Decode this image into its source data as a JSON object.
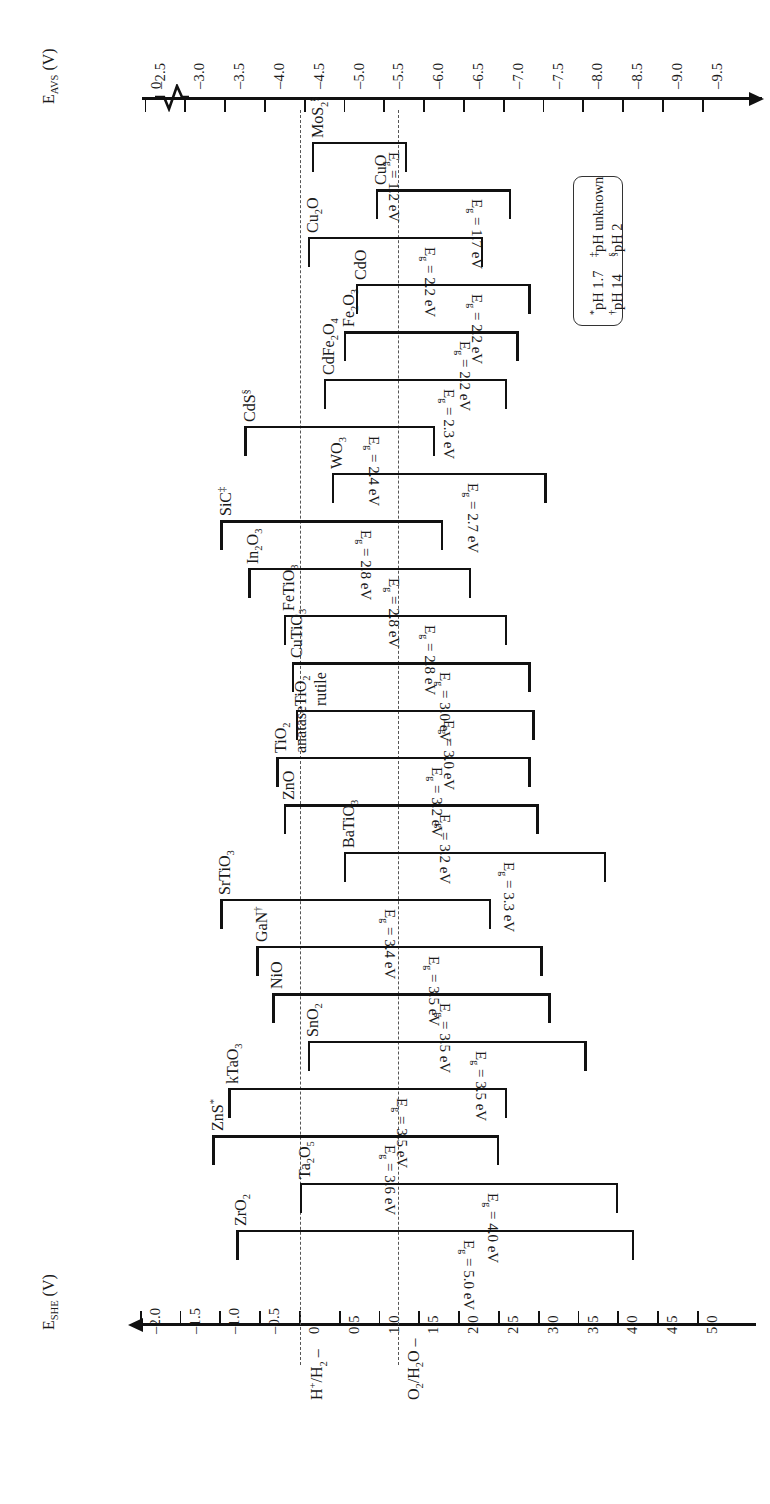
{
  "figure": {
    "top_axis": {
      "label_main": "E",
      "label_sub": "AVS",
      "label_unit": "(V)",
      "ticks": [
        "0",
        "–2.5",
        "–3.0",
        "–3.5",
        "–4.0",
        "–4.5",
        "–5.0",
        "–5.5",
        "–6.0",
        "–6.5",
        "–7.0",
        "–7.5",
        "–8.0",
        "–8.5",
        "–9.0",
        "–9.5"
      ]
    },
    "bottom_axis": {
      "label_main": "E",
      "label_sub": "SHE",
      "label_unit": "(V)",
      "ticks": [
        "–2.0",
        "–1.5",
        "–1.0",
        "–0.5",
        "0",
        "0.5",
        "1.0",
        "1.5",
        "2.0",
        "2.5",
        "3.0",
        "3.5",
        "4.0",
        "4.5",
        "5.0"
      ]
    },
    "redox_levels": [
      {
        "name": "hydrogen-redox",
        "label_html": "H<sup>+</sup>/H<sub>2</sub> –",
        "value_she": 0.0
      },
      {
        "name": "oxygen-redox",
        "label_html": "O<sub>2</sub>/H<sub>2</sub>O –",
        "value_she": 1.23
      }
    ],
    "legend": {
      "items": [
        {
          "marker": "*",
          "text": "pH 1.7"
        },
        {
          "marker": "†",
          "text": "pH 14"
        },
        {
          "marker": "‡",
          "text": "pH unknown"
        },
        {
          "marker": "§",
          "text": "pH 2"
        }
      ]
    }
  },
  "chart_data": {
    "type": "bar",
    "xlabel": "E_SHE (V)",
    "ylabel": "",
    "xlim": [
      -2.5,
      5.2
    ],
    "grid": false,
    "legend_position": "right",
    "note": "Each entry is a conduction-band (CBM) to valence-band (VBM) bracket on the SHE potential scale; gap = VBM - CBM.",
    "columns": [
      "material",
      "cbm_she_V",
      "vbm_she_V",
      "band_gap_eV",
      "gap_label",
      "ph_marker"
    ],
    "materials": [
      {
        "material": "MoS₂",
        "formula_html": "MoS<sub>2</sub><sup>§</sup>",
        "cbm_she_V": 0.15,
        "vbm_she_V": 1.35,
        "band_gap_eV": 1.2,
        "gap_label": "E<sub>g</sub> = 1.2 eV",
        "ph_marker": "§"
      },
      {
        "material": "CuO",
        "formula_html": "CuO",
        "cbm_she_V": 0.95,
        "vbm_she_V": 2.65,
        "band_gap_eV": 1.7,
        "gap_label": "E<sub>g</sub> = 1.7 eV",
        "ph_marker": ""
      },
      {
        "material": "Cu₂O",
        "formula_html": "Cu<sub>2</sub>O",
        "cbm_she_V": 0.1,
        "vbm_she_V": 2.3,
        "band_gap_eV": 2.2,
        "gap_label": "E<sub>g</sub> = 2.2 eV",
        "ph_marker": ""
      },
      {
        "material": "CdO",
        "formula_html": "CdO",
        "cbm_she_V": 0.7,
        "vbm_she_V": 2.9,
        "band_gap_eV": 2.2,
        "gap_label": "E<sub>g</sub> = 2.2 eV",
        "ph_marker": ""
      },
      {
        "material": "Fe₂O₃",
        "formula_html": "Fe<sub>2</sub>O<sub>3</sub>",
        "cbm_she_V": 0.55,
        "vbm_she_V": 2.75,
        "band_gap_eV": 2.2,
        "gap_label": "E<sub>g</sub> = 2.2 eV",
        "ph_marker": ""
      },
      {
        "material": "CdFe₂O₄",
        "formula_html": "CdFe<sub>2</sub>O<sub>4</sub>",
        "cbm_she_V": 0.3,
        "vbm_she_V": 2.6,
        "band_gap_eV": 2.3,
        "gap_label": "E<sub>g</sub> = 2.3 eV",
        "ph_marker": ""
      },
      {
        "material": "CdS",
        "formula_html": "CdS<sup>§</sup>",
        "cbm_she_V": -0.7,
        "vbm_she_V": 1.7,
        "band_gap_eV": 2.4,
        "gap_label": "E<sub>g</sub> = 2.4 eV",
        "ph_marker": "§"
      },
      {
        "material": "WO₃",
        "formula_html": "WO<sub>3</sub>",
        "cbm_she_V": 0.4,
        "vbm_she_V": 3.1,
        "band_gap_eV": 2.7,
        "gap_label": "E<sub>g</sub> = 2.7 eV",
        "ph_marker": ""
      },
      {
        "material": "SiC",
        "formula_html": "SiC<sup>‡</sup>",
        "cbm_she_V": -1.0,
        "vbm_she_V": 1.8,
        "band_gap_eV": 2.8,
        "gap_label": "E<sub>g</sub> = 2.8 eV",
        "ph_marker": "‡"
      },
      {
        "material": "In₂O₃",
        "formula_html": "In<sub>2</sub>O<sub>3</sub>",
        "cbm_she_V": -0.65,
        "vbm_she_V": 2.15,
        "band_gap_eV": 2.8,
        "gap_label": "E<sub>g</sub> = 2.8 eV",
        "ph_marker": ""
      },
      {
        "material": "FeTiO₃",
        "formula_html": "FeTiO<sub>3</sub>",
        "cbm_she_V": -0.2,
        "vbm_she_V": 2.6,
        "band_gap_eV": 2.8,
        "gap_label": "E<sub>g</sub> = 2.8 eV",
        "ph_marker": ""
      },
      {
        "material": "CuTiO₃",
        "formula_html": "CuTiO<sub>3</sub>",
        "cbm_she_V": -0.1,
        "vbm_she_V": 2.9,
        "band_gap_eV": 3.0,
        "gap_label": "E<sub>g</sub> = 3.0 eV",
        "ph_marker": ""
      },
      {
        "material": "TiO₂ rutile",
        "formula_html": "TiO<sub>2</sub><br>rutile",
        "cbm_she_V": -0.05,
        "vbm_she_V": 2.95,
        "band_gap_eV": 3.0,
        "gap_label": "E<sub>g</sub> = 3.0 eV",
        "ph_marker": ""
      },
      {
        "material": "TiO₂ anatase",
        "formula_html": "TiO<sub>2</sub><br>anatase",
        "cbm_she_V": -0.3,
        "vbm_she_V": 2.9,
        "band_gap_eV": 3.2,
        "gap_label": "E<sub>g</sub> = 3.2 eV",
        "ph_marker": ""
      },
      {
        "material": "ZnO",
        "formula_html": "ZnO",
        "cbm_she_V": -0.2,
        "vbm_she_V": 3.0,
        "band_gap_eV": 3.2,
        "gap_label": "E<sub>g</sub> = 3.2 eV",
        "ph_marker": ""
      },
      {
        "material": "BaTiO₃",
        "formula_html": "BaTiO<sub>3</sub>",
        "cbm_she_V": 0.55,
        "vbm_she_V": 3.85,
        "band_gap_eV": 3.3,
        "gap_label": "E<sub>g</sub> = 3.3 eV",
        "ph_marker": ""
      },
      {
        "material": "SrTiO₃",
        "formula_html": "SrTiO<sub>3</sub>",
        "cbm_she_V": -1.0,
        "vbm_she_V": 2.4,
        "band_gap_eV": 3.4,
        "gap_label": "E<sub>g</sub> = 3.4 eV",
        "ph_marker": ""
      },
      {
        "material": "GaN",
        "formula_html": "GaN<sup>†</sup>",
        "cbm_she_V": -0.55,
        "vbm_she_V": 3.05,
        "band_gap_eV": 3.5,
        "gap_label": "E<sub>g</sub> = 3.5 eV",
        "ph_marker": "†"
      },
      {
        "material": "NiO",
        "formula_html": "NiO",
        "cbm_she_V": -0.35,
        "vbm_she_V": 3.15,
        "band_gap_eV": 3.5,
        "gap_label": "E<sub>g</sub> = 3.5 eV",
        "ph_marker": ""
      },
      {
        "material": "SnO₂",
        "formula_html": "SnO<sub>2</sub>",
        "cbm_she_V": 0.1,
        "vbm_she_V": 3.6,
        "band_gap_eV": 3.5,
        "gap_label": "E<sub>g</sub> = 3.5 eV",
        "ph_marker": ""
      },
      {
        "material": "kTaO₃",
        "formula_html": "kTaO<sub>3</sub>",
        "cbm_she_V": -0.9,
        "vbm_she_V": 2.6,
        "band_gap_eV": 3.5,
        "gap_label": "E<sub>g</sub> = 3.5 eV",
        "ph_marker": ""
      },
      {
        "material": "ZnS",
        "formula_html": "ZnS<sup>*</sup>",
        "cbm_she_V": -1.1,
        "vbm_she_V": 2.5,
        "band_gap_eV": 3.6,
        "gap_label": "E<sub>g</sub> = 3.6 eV",
        "ph_marker": "*"
      },
      {
        "material": "Ta₂O₅",
        "formula_html": "Ta<sub>2</sub>O<sub>5</sub>",
        "cbm_she_V": 0.0,
        "vbm_she_V": 4.0,
        "band_gap_eV": 4.0,
        "gap_label": "E<sub>g</sub> = 4.0 eV",
        "ph_marker": ""
      },
      {
        "material": "ZrO₂",
        "formula_html": "ZrO<sub>2</sub>",
        "cbm_she_V": -0.8,
        "vbm_she_V": 4.2,
        "band_gap_eV": 5.0,
        "gap_label": "E<sub>g</sub> = 5.0 eV",
        "ph_marker": ""
      }
    ]
  }
}
